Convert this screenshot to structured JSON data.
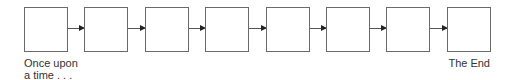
{
  "diagram": {
    "type": "linear-sequence",
    "box_count": 8,
    "boxes": [
      {
        "label": ""
      },
      {
        "label": ""
      },
      {
        "label": ""
      },
      {
        "label": ""
      },
      {
        "label": ""
      },
      {
        "label": ""
      },
      {
        "label": ""
      },
      {
        "label": ""
      }
    ],
    "start_label": "Once upon a time . . .",
    "start_label_lines": [
      "Once upon",
      "a time . . ."
    ],
    "end_label": "The End",
    "colors": {
      "box_border": "#6a6a6a",
      "arrow": "#222222",
      "text": "#333333"
    }
  }
}
